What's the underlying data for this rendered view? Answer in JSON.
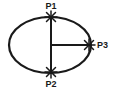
{
  "figure": {
    "background_color": "#ffffff",
    "stroke_color": "#1a1a1a",
    "width": 115,
    "height": 93
  },
  "shapes": {
    "ellipse": {
      "name": "ellipse-outline",
      "center_x": 50,
      "center_y": 45,
      "radius_x": 41,
      "radius_y": 28,
      "stroke_width": 2.2
    },
    "vertical_chord": {
      "name": "vertical-line-p1-p2",
      "x1": 51,
      "y1": 17,
      "x2": 51,
      "y2": 72,
      "stroke_width": 2
    },
    "horizontal_radius": {
      "name": "horizontal-line-center-p3",
      "x1": 51,
      "y1": 45,
      "x2": 89,
      "y2": 45,
      "stroke_width": 2
    }
  },
  "points": [
    {
      "id": "p1",
      "label": "P1",
      "marker": "star-marker",
      "x": 51,
      "y": 17,
      "label_x": 51,
      "label_y": 9,
      "label_anchor": "middle"
    },
    {
      "id": "p2",
      "label": "P2",
      "marker": "star-marker",
      "x": 51,
      "y": 72,
      "label_x": 51,
      "label_y": 87,
      "label_anchor": "middle"
    },
    {
      "id": "p3",
      "label": "P3",
      "marker": "star-marker",
      "x": 89,
      "y": 45,
      "label_x": 97,
      "label_y": 48,
      "label_anchor": "start"
    }
  ]
}
